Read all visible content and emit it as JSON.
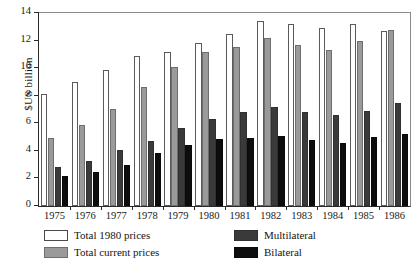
{
  "chart_data": {
    "type": "bar",
    "title": "",
    "xlabel": "",
    "ylabel": "$US billion",
    "ylim": [
      0,
      14
    ],
    "yticks": [
      0,
      2,
      4,
      6,
      8,
      10,
      12,
      14
    ],
    "ytick_labels": [
      "0",
      "2",
      "4",
      "6",
      "8",
      "10",
      "12",
      "14"
    ],
    "grid": false,
    "legend_position": "below-axes",
    "categories": [
      "1975",
      "1976",
      "1977",
      "1978",
      "1979",
      "1980",
      "1981",
      "1982",
      "1983",
      "1984",
      "1985",
      "1986"
    ],
    "series": [
      {
        "name": "Total 1980 prices",
        "color": "#ffffff",
        "values": [
          8.1,
          9.0,
          9.9,
          10.9,
          11.2,
          11.8,
          12.45,
          13.45,
          13.2,
          12.9,
          13.2,
          12.7
        ]
      },
      {
        "name": "Total current prices",
        "color": "#9a9a9a",
        "values": [
          4.95,
          5.9,
          7.05,
          8.65,
          10.05,
          11.15,
          11.55,
          12.2,
          11.7,
          11.3,
          12.0,
          12.8
        ]
      },
      {
        "name": "Multilateral",
        "color": "#3a3a3a",
        "values": [
          2.8,
          3.3,
          4.05,
          4.75,
          5.65,
          6.3,
          6.85,
          7.15,
          6.85,
          6.6,
          6.9,
          7.5
        ]
      },
      {
        "name": "Bilateral",
        "color": "#0d0d0d",
        "values": [
          2.15,
          2.5,
          3.0,
          3.85,
          4.4,
          4.85,
          4.95,
          5.1,
          4.8,
          4.6,
          5.0,
          5.2
        ]
      }
    ]
  },
  "legend": {
    "items": [
      {
        "label": "Total 1980 prices",
        "key": "total1980"
      },
      {
        "label": "Total current prices",
        "key": "totalcur"
      },
      {
        "label": "Multilateral",
        "key": "multi"
      },
      {
        "label": "Bilateral",
        "key": "bilat"
      }
    ]
  }
}
